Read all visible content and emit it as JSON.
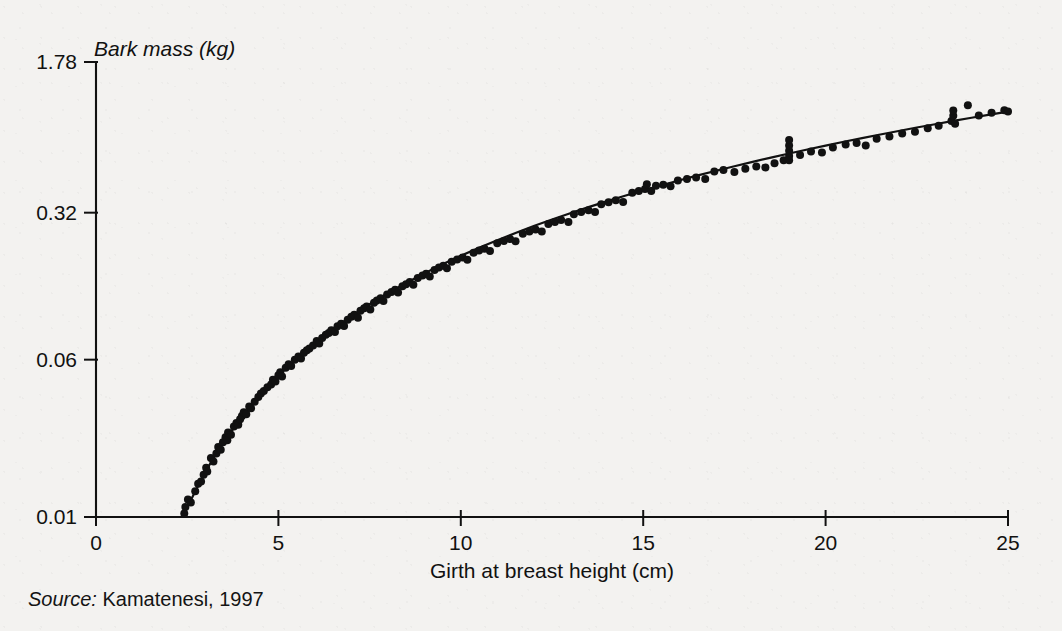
{
  "figure": {
    "source_prefix": "Source:",
    "source_text": "Kamatenesi, 1997",
    "ink_color": "#111111",
    "paper_color": "#f3f2f0"
  },
  "chart_data": {
    "type": "scatter",
    "title": "",
    "xlabel": "Girth at breast height (cm)",
    "ylabel": "Bark mass (kg)",
    "yscale": "log",
    "xscale": "linear",
    "grid": false,
    "legend": null,
    "xlim": [
      0,
      25
    ],
    "ylim": [
      0.01,
      1.78
    ],
    "xticks": [
      0,
      5,
      10,
      15,
      20,
      25
    ],
    "xticklabels": [
      "0",
      "5",
      "10",
      "15",
      "20",
      "25"
    ],
    "yticks": [
      0.01,
      0.06,
      0.32,
      1.78
    ],
    "yticklabels": [
      "0.01",
      "0.06",
      "0.32",
      "1.78"
    ],
    "annotations": [],
    "fit_curve": {
      "name": "fitted power-law regression",
      "x": [
        2.4,
        3.0,
        3.5,
        4.0,
        4.5,
        5.0,
        5.5,
        6.0,
        6.5,
        7.0,
        7.5,
        8.0,
        8.5,
        9.0,
        9.5,
        10.0,
        10.5,
        11.0,
        11.5,
        12.0,
        12.5,
        13.0,
        13.5,
        14.0,
        14.5,
        15.0,
        15.5,
        16.0,
        16.5,
        17.0,
        17.5,
        18.0,
        18.5,
        19.0,
        19.5,
        20.0,
        20.5,
        21.0,
        21.5,
        22.0,
        22.5,
        23.0,
        23.5,
        24.0,
        24.5,
        25.0
      ],
      "y": [
        0.0103,
        0.0168,
        0.0235,
        0.0313,
        0.0402,
        0.05,
        0.0608,
        0.0725,
        0.0851,
        0.0985,
        0.1128,
        0.1279,
        0.1437,
        0.1603,
        0.1777,
        0.1957,
        0.2145,
        0.2339,
        0.254,
        0.2748,
        0.2962,
        0.3182,
        0.3409,
        0.3641,
        0.388,
        0.4124,
        0.4374,
        0.463,
        0.4892,
        0.5159,
        0.5431,
        0.5709,
        0.5992,
        0.628,
        0.6574,
        0.6872,
        0.7176,
        0.7484,
        0.7797,
        0.8115,
        0.8438,
        0.8765,
        0.9097,
        0.9433,
        0.9774,
        1.012
      ]
    },
    "series": [
      {
        "name": "observations",
        "marker": "filled-circle",
        "marker_color": "#111111",
        "marker_size_px": 8,
        "n_points": 152,
        "points": [
          [
            2.42,
            0.0104
          ],
          [
            2.45,
            0.0112
          ],
          [
            2.52,
            0.0122
          ],
          [
            2.6,
            0.0118
          ],
          [
            2.72,
            0.0134
          ],
          [
            2.8,
            0.0146
          ],
          [
            2.88,
            0.015
          ],
          [
            2.95,
            0.0162
          ],
          [
            3.02,
            0.0175
          ],
          [
            3.05,
            0.0168
          ],
          [
            3.15,
            0.0196
          ],
          [
            3.22,
            0.0188
          ],
          [
            3.3,
            0.0206
          ],
          [
            3.35,
            0.0222
          ],
          [
            3.42,
            0.0215
          ],
          [
            3.48,
            0.0234
          ],
          [
            3.55,
            0.0248
          ],
          [
            3.6,
            0.024
          ],
          [
            3.62,
            0.0262
          ],
          [
            3.7,
            0.0255
          ],
          [
            3.78,
            0.028
          ],
          [
            3.85,
            0.0292
          ],
          [
            3.9,
            0.0286
          ],
          [
            3.95,
            0.0304
          ],
          [
            4.0,
            0.0316
          ],
          [
            4.05,
            0.033
          ],
          [
            4.12,
            0.0322
          ],
          [
            4.2,
            0.0352
          ],
          [
            4.25,
            0.0345
          ],
          [
            4.35,
            0.0372
          ],
          [
            4.45,
            0.0392
          ],
          [
            4.52,
            0.0408
          ],
          [
            4.6,
            0.042
          ],
          [
            4.7,
            0.0438
          ],
          [
            4.8,
            0.0452
          ],
          [
            4.85,
            0.0478
          ],
          [
            4.92,
            0.0468
          ],
          [
            5.0,
            0.0502
          ],
          [
            5.05,
            0.052
          ],
          [
            5.1,
            0.0495
          ],
          [
            5.2,
            0.0548
          ],
          [
            5.28,
            0.057
          ],
          [
            5.35,
            0.0558
          ],
          [
            5.45,
            0.06
          ],
          [
            5.55,
            0.0622
          ],
          [
            5.62,
            0.0608
          ],
          [
            5.7,
            0.065
          ],
          [
            5.78,
            0.0668
          ],
          [
            5.85,
            0.0682
          ],
          [
            5.95,
            0.0706
          ],
          [
            6.05,
            0.0742
          ],
          [
            6.12,
            0.0722
          ],
          [
            6.2,
            0.0768
          ],
          [
            6.3,
            0.0796
          ],
          [
            6.38,
            0.0812
          ],
          [
            6.45,
            0.084
          ],
          [
            6.55,
            0.0822
          ],
          [
            6.62,
            0.0878
          ],
          [
            6.72,
            0.0902
          ],
          [
            6.8,
            0.088
          ],
          [
            6.9,
            0.0946
          ],
          [
            7.0,
            0.0978
          ],
          [
            7.08,
            0.1002
          ],
          [
            7.18,
            0.0968
          ],
          [
            7.25,
            0.1048
          ],
          [
            7.35,
            0.1078
          ],
          [
            7.42,
            0.11
          ],
          [
            7.52,
            0.1062
          ],
          [
            7.62,
            0.1148
          ],
          [
            7.7,
            0.1178
          ],
          [
            7.8,
            0.1208
          ],
          [
            7.88,
            0.1172
          ],
          [
            7.98,
            0.1262
          ],
          [
            8.1,
            0.1298
          ],
          [
            8.2,
            0.133
          ],
          [
            8.28,
            0.1288
          ],
          [
            8.4,
            0.1385
          ],
          [
            8.5,
            0.1418
          ],
          [
            8.6,
            0.1452
          ],
          [
            8.7,
            0.141
          ],
          [
            8.82,
            0.152
          ],
          [
            8.95,
            0.1565
          ],
          [
            9.05,
            0.1598
          ],
          [
            9.15,
            0.1548
          ],
          [
            9.28,
            0.1668
          ],
          [
            9.4,
            0.1712
          ],
          [
            9.52,
            0.1748
          ],
          [
            9.62,
            0.17
          ],
          [
            9.75,
            0.183
          ],
          [
            9.9,
            0.1878
          ],
          [
            10.05,
            0.192
          ],
          [
            10.18,
            0.187
          ],
          [
            10.35,
            0.2028
          ],
          [
            10.5,
            0.2082
          ],
          [
            10.65,
            0.212
          ],
          [
            10.8,
            0.207
          ],
          [
            11.0,
            0.2258
          ],
          [
            11.18,
            0.2318
          ],
          [
            11.35,
            0.2368
          ],
          [
            11.5,
            0.231
          ],
          [
            11.7,
            0.252
          ],
          [
            11.88,
            0.2585
          ],
          [
            12.05,
            0.264
          ],
          [
            12.22,
            0.258
          ],
          [
            12.4,
            0.2812
          ],
          [
            12.58,
            0.288
          ],
          [
            12.75,
            0.294
          ],
          [
            12.95,
            0.288
          ],
          [
            13.1,
            0.314
          ],
          [
            13.3,
            0.3225
          ],
          [
            13.5,
            0.329
          ],
          [
            13.68,
            0.3222
          ],
          [
            13.85,
            0.352
          ],
          [
            14.05,
            0.3602
          ],
          [
            14.25,
            0.369
          ],
          [
            14.45,
            0.3615
          ],
          [
            14.7,
            0.4012
          ],
          [
            14.88,
            0.4098
          ],
          [
            15.05,
            0.419
          ],
          [
            15.22,
            0.41
          ],
          [
            15.1,
            0.442
          ],
          [
            15.35,
            0.435
          ],
          [
            15.55,
            0.4402
          ],
          [
            15.75,
            0.432
          ],
          [
            15.95,
            0.462
          ],
          [
            16.2,
            0.47
          ],
          [
            16.45,
            0.478
          ],
          [
            16.7,
            0.47
          ],
          [
            16.95,
            0.512
          ],
          [
            17.2,
            0.521
          ],
          [
            17.5,
            0.508
          ],
          [
            17.8,
            0.528
          ],
          [
            18.1,
            0.542
          ],
          [
            18.35,
            0.536
          ],
          [
            18.6,
            0.562
          ],
          [
            18.85,
            0.582
          ],
          [
            19.0,
            0.61
          ],
          [
            19.0,
            0.648
          ],
          [
            19.0,
            0.688
          ],
          [
            19.0,
            0.732
          ],
          [
            19.0,
            0.582
          ],
          [
            19.3,
            0.618
          ],
          [
            19.6,
            0.642
          ],
          [
            19.9,
            0.635
          ],
          [
            20.2,
            0.672
          ],
          [
            20.55,
            0.695
          ],
          [
            20.85,
            0.708
          ],
          [
            21.1,
            0.688
          ],
          [
            21.4,
            0.742
          ],
          [
            21.75,
            0.762
          ],
          [
            22.1,
            0.788
          ],
          [
            22.45,
            0.805
          ],
          [
            22.8,
            0.838
          ],
          [
            23.1,
            0.862
          ],
          [
            23.45,
            0.908
          ],
          [
            23.5,
            0.965
          ],
          [
            23.5,
            1.025
          ],
          [
            23.55,
            0.882
          ],
          [
            23.9,
            1.088
          ],
          [
            24.2,
            0.968
          ],
          [
            24.55,
            0.998
          ],
          [
            24.9,
            1.028
          ],
          [
            25.0,
            1.012
          ]
        ]
      }
    ]
  }
}
